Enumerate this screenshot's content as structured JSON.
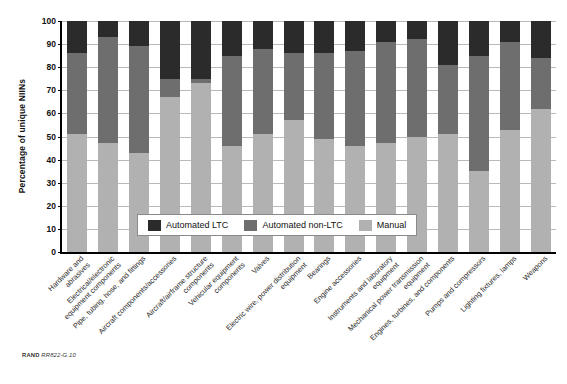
{
  "figure": {
    "source_note_prefix": "RAND",
    "source_note_id": "RR822-G.10"
  },
  "chart_data": {
    "type": "bar",
    "subtype": "stacked-vertical-100percent",
    "title": "",
    "xlabel": "",
    "ylabel": "Percentage of unique NIINs",
    "ylim": [
      0,
      100
    ],
    "yticks": [
      0,
      10,
      20,
      30,
      40,
      50,
      60,
      70,
      80,
      90,
      100
    ],
    "ytick_labels": [
      "0",
      "10",
      "20",
      "30",
      "40",
      "50",
      "60",
      "70",
      "80",
      "90",
      "100"
    ],
    "grid": true,
    "legend_position": "inside-bottom-center",
    "categories": [
      "Hardware and abrasives",
      "Electrical/electronic equipment components",
      "Pipe, tubing, hose, and fittings",
      "Aircraft components/accessories",
      "Aircraft/airframe structure components",
      "Vehicular equipment components",
      "Valves",
      "Electric wire, power distribution equipment",
      "Bearings",
      "Engine accessories",
      "Instruments and laboratory equipment",
      "Mechanical power transmission equipment",
      "Engines, turbines, and components",
      "Pumps and compressors",
      "Lighting fixtures, lamps",
      "Weapons"
    ],
    "category_lines": [
      [
        "Hardware and",
        "abrasives"
      ],
      [
        "Electrical/electronic",
        "equipment components"
      ],
      [
        "Pipe, tubing, hose, and fittings"
      ],
      [
        "Aircraft components/accessories"
      ],
      [
        "Aircraft/airframe structure",
        "components"
      ],
      [
        "Vehicular equipment",
        "components"
      ],
      [
        "Valves"
      ],
      [
        "Electric wire, power distribution",
        "equipment"
      ],
      [
        "Bearings"
      ],
      [
        "Engine accessories"
      ],
      [
        "Instruments and laboratory",
        "equipment"
      ],
      [
        "Mechanical power transmission",
        "equipment"
      ],
      [
        "Engines, turbines, and components"
      ],
      [
        "Pumps and compressors"
      ],
      [
        "Lighting fixtures, lamps"
      ],
      [
        "Weapons"
      ]
    ],
    "series": [
      {
        "name": "Manual",
        "color": "#b1b1b1",
        "values": [
          51,
          47,
          43,
          67,
          73,
          46,
          51,
          57,
          49,
          46,
          47,
          50,
          51,
          35,
          53,
          62
        ]
      },
      {
        "name": "Automated non-LTC",
        "color": "#6e6e6e",
        "values": [
          35,
          46,
          46,
          8,
          2,
          39,
          37,
          29,
          37,
          41,
          44,
          42,
          30,
          50,
          38,
          22
        ]
      },
      {
        "name": "Automated LTC",
        "color": "#2b2b2b",
        "values": [
          14,
          7,
          11,
          25,
          25,
          15,
          12,
          14,
          14,
          13,
          9,
          8,
          19,
          15,
          9,
          16
        ]
      }
    ],
    "stack_tops": {
      "manual": [
        51,
        47,
        43,
        67,
        73,
        46,
        51,
        57,
        49,
        46,
        47,
        50,
        51,
        35,
        53,
        62
      ],
      "manual_plus_nonltc": [
        86,
        93,
        89,
        75,
        75,
        85,
        88,
        86,
        86,
        87,
        91,
        92,
        81,
        85,
        91,
        84
      ]
    }
  },
  "legend": {
    "items": [
      {
        "label": "Automated LTC",
        "color": "#2b2b2b"
      },
      {
        "label": "Automated non-LTC",
        "color": "#6e6e6e"
      },
      {
        "label": "Manual",
        "color": "#b1b1b1"
      }
    ]
  }
}
